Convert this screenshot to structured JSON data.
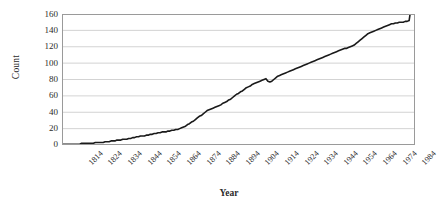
{
  "chart_data": {
    "type": "line",
    "title": "",
    "xlabel": "Year",
    "ylabel": "Count",
    "xlim": [
      1810,
      1990
    ],
    "ylim": [
      0,
      160
    ],
    "y_ticks": [
      0,
      20,
      40,
      60,
      80,
      100,
      120,
      140,
      160
    ],
    "x_ticks": [
      1814,
      1824,
      1834,
      1844,
      1854,
      1864,
      1874,
      1884,
      1894,
      1904,
      1914,
      1924,
      1934,
      1944,
      1954,
      1964,
      1974,
      1984
    ],
    "grid": "horizontal",
    "legend": "none",
    "line_color": "#1a1a1a",
    "grid_color": "#c8c8c8",
    "axis_color": "#808080",
    "series": [
      {
        "name": "Count",
        "x": [
          1810,
          1811,
          1812,
          1813,
          1814,
          1815,
          1816,
          1817,
          1818,
          1819,
          1820,
          1821,
          1822,
          1823,
          1824,
          1825,
          1826,
          1827,
          1828,
          1829,
          1830,
          1831,
          1832,
          1833,
          1834,
          1835,
          1836,
          1837,
          1838,
          1839,
          1840,
          1841,
          1842,
          1843,
          1844,
          1845,
          1846,
          1847,
          1848,
          1849,
          1850,
          1851,
          1852,
          1853,
          1854,
          1855,
          1856,
          1857,
          1858,
          1859,
          1860,
          1861,
          1862,
          1863,
          1864,
          1865,
          1866,
          1867,
          1868,
          1869,
          1870,
          1871,
          1872,
          1873,
          1874,
          1875,
          1876,
          1877,
          1878,
          1879,
          1880,
          1881,
          1882,
          1883,
          1884,
          1885,
          1886,
          1887,
          1888,
          1889,
          1890,
          1891,
          1892,
          1893,
          1894,
          1895,
          1896,
          1897,
          1898,
          1899,
          1900,
          1901,
          1902,
          1903,
          1904,
          1905,
          1906,
          1907,
          1908,
          1909,
          1910,
          1911,
          1912,
          1913,
          1914,
          1915,
          1916,
          1917,
          1918,
          1919,
          1920,
          1921,
          1922,
          1923,
          1924,
          1925,
          1926,
          1927,
          1928,
          1929,
          1930,
          1931,
          1932,
          1933,
          1934,
          1935,
          1936,
          1937,
          1938,
          1939,
          1940,
          1941,
          1942,
          1943,
          1944,
          1945,
          1946,
          1947,
          1948,
          1949,
          1950,
          1951,
          1952,
          1953,
          1954,
          1955,
          1956,
          1957,
          1958,
          1959,
          1960,
          1961,
          1962,
          1963,
          1964,
          1965,
          1966,
          1967,
          1968,
          1969,
          1970,
          1971,
          1972,
          1973,
          1974,
          1975,
          1976,
          1977,
          1978,
          1979,
          1980,
          1981,
          1982,
          1983,
          1984,
          1985,
          1986,
          1987,
          1988,
          1989
        ],
        "values": [
          1,
          1,
          1,
          1,
          1,
          1,
          1,
          1,
          1,
          1,
          2,
          2,
          2,
          2,
          2,
          2,
          2,
          3,
          3,
          3,
          3,
          3,
          4,
          4,
          4,
          5,
          5,
          5,
          6,
          6,
          6,
          7,
          7,
          7,
          8,
          8,
          9,
          9,
          10,
          10,
          11,
          11,
          11,
          12,
          12,
          13,
          13,
          14,
          14,
          15,
          15,
          16,
          16,
          16,
          17,
          17,
          18,
          18,
          19,
          19,
          20,
          21,
          22,
          23,
          25,
          26,
          28,
          29,
          31,
          33,
          35,
          36,
          38,
          40,
          42,
          43,
          44,
          45,
          46,
          47,
          48,
          49,
          51,
          52,
          53,
          55,
          56,
          58,
          60,
          62,
          63,
          65,
          66,
          68,
          70,
          71,
          72,
          74,
          75,
          76,
          77,
          78,
          79,
          80,
          81,
          78,
          77,
          78,
          80,
          82,
          84,
          85,
          86,
          87,
          88,
          89,
          90,
          91,
          92,
          93,
          94,
          95,
          96,
          97,
          98,
          99,
          100,
          101,
          102,
          103,
          104,
          105,
          106,
          107,
          108,
          109,
          110,
          111,
          112,
          113,
          114,
          115,
          116,
          117,
          118,
          118,
          119,
          120,
          121,
          122,
          124,
          126,
          128,
          130,
          132,
          134,
          136,
          137,
          138,
          139,
          140,
          141,
          142,
          143,
          144,
          145,
          146,
          147,
          148,
          148,
          149,
          149,
          150,
          150,
          150,
          151,
          151,
          152,
          168,
          170
        ]
      }
    ]
  },
  "axis": {
    "y_title": "Count",
    "x_title": "Year",
    "y_labels": [
      "160",
      "140",
      "120",
      "100",
      "80",
      "60",
      "40",
      "20",
      "0"
    ],
    "x_labels": [
      "1814",
      "1824",
      "1834",
      "1844",
      "1854",
      "1864",
      "1874",
      "1884",
      "1894",
      "1904",
      "1914",
      "1924",
      "1934",
      "1944",
      "1954",
      "1964",
      "1974",
      "1984"
    ]
  }
}
